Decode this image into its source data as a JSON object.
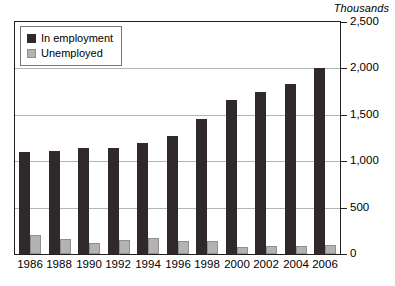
{
  "chart_data": {
    "type": "bar",
    "title": "",
    "subtitle": "",
    "units_caption": "Thousands",
    "xlabel": "",
    "ylabel": "",
    "ylim": [
      0,
      2500
    ],
    "ytick_values": [
      0,
      500,
      1000,
      1500,
      2000,
      2500
    ],
    "ytick_labels": [
      "0",
      "500",
      "1,000",
      "1,500",
      "2,000",
      "2,500"
    ],
    "grid": true,
    "grid_axis": "y",
    "legend_position": "top-left",
    "categories": [
      "1986",
      "1988",
      "1990",
      "1992",
      "1994",
      "1996",
      "1998",
      "2000",
      "2002",
      "2004",
      "2006"
    ],
    "series": [
      {
        "name": "In employment",
        "color": "#2f2a29",
        "values": [
          1100,
          1110,
          1140,
          1140,
          1200,
          1270,
          1460,
          1660,
          1750,
          1830,
          2000
        ]
      },
      {
        "name": "Unemployed",
        "color": "#b3b3b3",
        "values": [
          200,
          160,
          120,
          150,
          170,
          140,
          140,
          75,
          85,
          85,
          95
        ]
      }
    ]
  },
  "legend": {
    "items": [
      {
        "label": "In employment",
        "swatch": "dark"
      },
      {
        "label": "Unemployed",
        "swatch": "light"
      }
    ]
  }
}
